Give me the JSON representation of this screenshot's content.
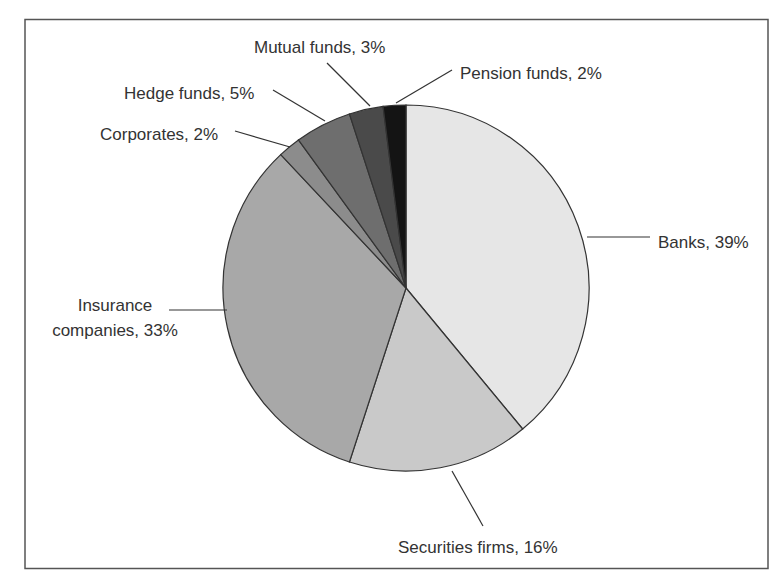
{
  "chart_data": {
    "type": "pie",
    "title": "",
    "start_angle_deg": 0,
    "direction": "clockwise",
    "slices": [
      {
        "label": "Banks",
        "value": 39,
        "display": "Banks, 39%",
        "color": "#e6e6e6"
      },
      {
        "label": "Securities firms",
        "value": 16,
        "display": "Securities firms, 16%",
        "color": "#c9c9c9"
      },
      {
        "label": "Insurance companies",
        "value": 33,
        "display": "Insurance companies, 33%",
        "display_lines": [
          "Insurance",
          "companies, 33%"
        ],
        "color": "#a8a8a8"
      },
      {
        "label": "Corporates",
        "value": 2,
        "display": "Corporates, 2%",
        "color": "#8c8c8c"
      },
      {
        "label": "Hedge funds",
        "value": 5,
        "display": "Hedge funds, 5%",
        "color": "#6e6e6e"
      },
      {
        "label": "Mutual funds",
        "value": 3,
        "display": "Mutual funds, 3%",
        "color": "#4a4a4a"
      },
      {
        "label": "Pension funds",
        "value": 2,
        "display": "Pension funds, 2%",
        "color": "#141414"
      }
    ],
    "legend": "none (direct leader-line labels)",
    "units": "%"
  },
  "labels": {
    "banks": "Banks, 39%",
    "securities": "Securities firms, 16%",
    "insurance_line1": "Insurance",
    "insurance_line2": "companies, 33%",
    "corporates": "Corporates, 2%",
    "hedge": "Hedge funds, 5%",
    "mutual": "Mutual funds, 3%",
    "pension": "Pension funds, 2%"
  }
}
